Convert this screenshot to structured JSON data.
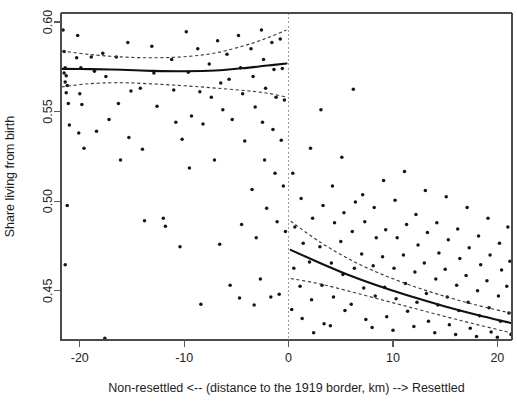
{
  "figure": {
    "kind": "regression-discontinuity-scatterplot",
    "background_color": "#ffffff",
    "point_color": "#151515",
    "fit_color": "#101010",
    "ci_color": "#3b3b3b",
    "cutoff_color": "#9a9a9a"
  },
  "chart_data": {
    "type": "scatter",
    "title": "",
    "subtitle": "",
    "xlabel": "Non-resettled <-- (distance to the 1919 border, km) --> Resettled",
    "ylabel": "Share living from birth",
    "xlim": [
      -21.8,
      21.4
    ],
    "ylim": [
      0.4225,
      0.605
    ],
    "xticks": [
      -20,
      -10,
      0,
      10,
      20
    ],
    "xtick_labels": [
      "-20",
      "-10",
      "0",
      "10",
      "20"
    ],
    "yticks": [
      0.45,
      0.5,
      0.55,
      0.6
    ],
    "ytick_labels": [
      "0.45",
      "0.50",
      "0.55",
      "0.60"
    ],
    "grid": false,
    "legend": null,
    "cutoff": 0,
    "cutoff_style": "dotted-vertical",
    "points": [
      [
        -21.6,
        0.5955
      ],
      [
        -21.5,
        0.5835
      ],
      [
        -21.4,
        0.5745
      ],
      [
        -21.5,
        0.5715
      ],
      [
        -21.3,
        0.57
      ],
      [
        -21.4,
        0.5665
      ],
      [
        -21.2,
        0.5645
      ],
      [
        -21.3,
        0.5605
      ],
      [
        -21.1,
        0.5545
      ],
      [
        -21.0,
        0.5425
      ],
      [
        -21.2,
        0.4975
      ],
      [
        -21.4,
        0.4645
      ],
      [
        -20.2,
        0.5925
      ],
      [
        -20.3,
        0.58
      ],
      [
        -19.9,
        0.5745
      ],
      [
        -20.0,
        0.56
      ],
      [
        -19.8,
        0.554
      ],
      [
        -20.1,
        0.538
      ],
      [
        -19.6,
        0.5295
      ],
      [
        -18.9,
        0.5805
      ],
      [
        -18.6,
        0.5725
      ],
      [
        -18.4,
        0.539
      ],
      [
        -17.8,
        0.5825
      ],
      [
        -17.5,
        0.5695
      ],
      [
        -17.2,
        0.5455
      ],
      [
        -17.6,
        0.4235
      ],
      [
        -16.5,
        0.5805
      ],
      [
        -16.3,
        0.5545
      ],
      [
        -16.1,
        0.523
      ],
      [
        -15.4,
        0.5885
      ],
      [
        -15.1,
        0.5615
      ],
      [
        -15.3,
        0.5355
      ],
      [
        -14.2,
        0.563
      ],
      [
        -14.0,
        0.529
      ],
      [
        -13.8,
        0.489
      ],
      [
        -13.1,
        0.5865
      ],
      [
        -12.9,
        0.5715
      ],
      [
        -12.6,
        0.553
      ],
      [
        -12.0,
        0.4905
      ],
      [
        -11.8,
        0.486
      ],
      [
        -11.2,
        0.579
      ],
      [
        -11.0,
        0.562
      ],
      [
        -10.8,
        0.544
      ],
      [
        -10.4,
        0.4745
      ],
      [
        -10.2,
        0.5345
      ],
      [
        -9.8,
        0.5945
      ],
      [
        -9.6,
        0.572
      ],
      [
        -9.3,
        0.5475
      ],
      [
        -9.5,
        0.5185
      ],
      [
        -8.7,
        0.585
      ],
      [
        -8.5,
        0.561
      ],
      [
        -8.2,
        0.543
      ],
      [
        -8.4,
        0.4425
      ],
      [
        -7.6,
        0.5765
      ],
      [
        -7.4,
        0.558
      ],
      [
        -7.1,
        0.523
      ],
      [
        -6.8,
        0.5895
      ],
      [
        -6.5,
        0.566
      ],
      [
        -6.3,
        0.551
      ],
      [
        -6.6,
        0.476
      ],
      [
        -5.9,
        0.582
      ],
      [
        -5.7,
        0.568
      ],
      [
        -5.4,
        0.5455
      ],
      [
        -5.6,
        0.453
      ],
      [
        -4.8,
        0.5925
      ],
      [
        -4.6,
        0.5745
      ],
      [
        -4.4,
        0.56
      ],
      [
        -4.2,
        0.5335
      ],
      [
        -4.5,
        0.487
      ],
      [
        -4.7,
        0.446
      ],
      [
        -3.6,
        0.585
      ],
      [
        -3.4,
        0.5695
      ],
      [
        -3.2,
        0.5525
      ],
      [
        -3.5,
        0.5065
      ],
      [
        -3.1,
        0.4795
      ],
      [
        -3.3,
        0.442
      ],
      [
        -2.6,
        0.5955
      ],
      [
        -2.4,
        0.579
      ],
      [
        -2.2,
        0.563
      ],
      [
        -2.5,
        0.544
      ],
      [
        -2.3,
        0.523
      ],
      [
        -2.1,
        0.496
      ],
      [
        -2.7,
        0.4565
      ],
      [
        -1.6,
        0.5885
      ],
      [
        -1.4,
        0.5735
      ],
      [
        -1.2,
        0.558
      ],
      [
        -1.5,
        0.54
      ],
      [
        -1.3,
        0.5155
      ],
      [
        -1.1,
        0.4885
      ],
      [
        -1.7,
        0.4465
      ],
      [
        -0.8,
        0.5905
      ],
      [
        -0.6,
        0.574
      ],
      [
        -0.4,
        0.5565
      ],
      [
        -0.7,
        0.534
      ],
      [
        -0.5,
        0.5085
      ],
      [
        -0.3,
        0.483
      ],
      [
        -0.9,
        0.448
      ],
      [
        0.4,
        0.5155
      ],
      [
        0.6,
        0.4855
      ],
      [
        0.5,
        0.4625
      ],
      [
        0.3,
        0.4395
      ],
      [
        1.2,
        0.5015
      ],
      [
        1.4,
        0.4765
      ],
      [
        1.1,
        0.4525
      ],
      [
        1.3,
        0.4345
      ],
      [
        2.1,
        0.5295
      ],
      [
        2.3,
        0.4905
      ],
      [
        2.0,
        0.466
      ],
      [
        2.2,
        0.445
      ],
      [
        2.4,
        0.4265
      ],
      [
        3.1,
        0.551
      ],
      [
        3.3,
        0.4975
      ],
      [
        3.0,
        0.4745
      ],
      [
        3.2,
        0.453
      ],
      [
        3.4,
        0.4315
      ],
      [
        4.2,
        0.5085
      ],
      [
        4.4,
        0.488
      ],
      [
        4.1,
        0.4655
      ],
      [
        4.3,
        0.4465
      ],
      [
        4.0,
        0.4305
      ],
      [
        5.1,
        0.5245
      ],
      [
        5.3,
        0.4935
      ],
      [
        5.0,
        0.4775
      ],
      [
        5.2,
        0.459
      ],
      [
        5.4,
        0.439
      ],
      [
        6.2,
        0.5625
      ],
      [
        6.4,
        0.4995
      ],
      [
        6.1,
        0.483
      ],
      [
        6.3,
        0.4625
      ],
      [
        6.0,
        0.4425
      ],
      [
        7.1,
        0.5035
      ],
      [
        7.3,
        0.4885
      ],
      [
        7.0,
        0.4705
      ],
      [
        7.2,
        0.4515
      ],
      [
        7.4,
        0.434
      ],
      [
        8.2,
        0.4965
      ],
      [
        8.4,
        0.4795
      ],
      [
        8.1,
        0.464
      ],
      [
        8.3,
        0.447
      ],
      [
        8.0,
        0.4295
      ],
      [
        9.1,
        0.5115
      ],
      [
        9.3,
        0.484
      ],
      [
        9.0,
        0.469
      ],
      [
        9.2,
        0.452
      ],
      [
        9.4,
        0.4355
      ],
      [
        10.2,
        0.5005
      ],
      [
        10.4,
        0.4795
      ],
      [
        10.1,
        0.4625
      ],
      [
        10.3,
        0.4455
      ],
      [
        10.0,
        0.428
      ],
      [
        11.1,
        0.5165
      ],
      [
        11.3,
        0.487
      ],
      [
        11.0,
        0.47
      ],
      [
        11.2,
        0.454
      ],
      [
        11.4,
        0.4385
      ],
      [
        12.2,
        0.4925
      ],
      [
        12.4,
        0.4755
      ],
      [
        12.1,
        0.4605
      ],
      [
        12.3,
        0.4435
      ],
      [
        12.0,
        0.43
      ],
      [
        13.1,
        0.506
      ],
      [
        13.3,
        0.4825
      ],
      [
        13.0,
        0.4655
      ],
      [
        13.2,
        0.4485
      ],
      [
        13.4,
        0.433
      ],
      [
        14.2,
        0.488
      ],
      [
        14.4,
        0.471
      ],
      [
        14.1,
        0.4565
      ],
      [
        14.3,
        0.442
      ],
      [
        14.0,
        0.4265
      ],
      [
        15.1,
        0.5025
      ],
      [
        15.3,
        0.4785
      ],
      [
        15.0,
        0.462
      ],
      [
        15.2,
        0.4465
      ],
      [
        15.4,
        0.431
      ],
      [
        16.2,
        0.4845
      ],
      [
        16.4,
        0.468
      ],
      [
        16.1,
        0.453
      ],
      [
        16.3,
        0.439
      ],
      [
        16.0,
        0.4255
      ],
      [
        17.1,
        0.4965
      ],
      [
        17.3,
        0.474
      ],
      [
        17.0,
        0.4585
      ],
      [
        17.2,
        0.4435
      ],
      [
        17.4,
        0.429
      ],
      [
        18.2,
        0.4805
      ],
      [
        18.4,
        0.4645
      ],
      [
        18.1,
        0.45
      ],
      [
        18.3,
        0.436
      ],
      [
        18.0,
        0.4245
      ],
      [
        19.1,
        0.4905
      ],
      [
        19.3,
        0.47
      ],
      [
        19.0,
        0.4555
      ],
      [
        19.2,
        0.4405
      ],
      [
        19.4,
        0.427
      ],
      [
        20.2,
        0.4765
      ],
      [
        20.4,
        0.4615
      ],
      [
        20.1,
        0.447
      ],
      [
        20.3,
        0.433
      ],
      [
        20.0,
        0.424
      ],
      [
        21.0,
        0.4855
      ],
      [
        21.2,
        0.4665
      ],
      [
        20.9,
        0.4525
      ],
      [
        21.1,
        0.4375
      ],
      [
        21.3,
        0.4255
      ]
    ],
    "series": [
      {
        "name": "fit-left",
        "side": "non-resettled",
        "style": "solid",
        "x": [
          -21.7,
          -19,
          -16,
          -13,
          -10,
          -7,
          -4,
          -2,
          -0.2
        ],
        "y": [
          0.5738,
          0.5737,
          0.5733,
          0.5727,
          0.5725,
          0.5729,
          0.5744,
          0.5757,
          0.5768
        ]
      },
      {
        "name": "ci-upper-left",
        "side": "non-resettled",
        "style": "dashed",
        "x": [
          -21.7,
          -19,
          -16,
          -13,
          -10,
          -7,
          -4,
          -2,
          -0.2
        ],
        "y": [
          0.5838,
          0.5818,
          0.5805,
          0.58,
          0.5806,
          0.5827,
          0.5872,
          0.5912,
          0.5955
        ]
      },
      {
        "name": "ci-lower-left",
        "side": "non-resettled",
        "style": "dashed",
        "x": [
          -21.7,
          -19,
          -16,
          -13,
          -10,
          -7,
          -4,
          -2,
          -0.2
        ],
        "y": [
          0.5638,
          0.5656,
          0.5661,
          0.5654,
          0.5644,
          0.5631,
          0.5616,
          0.5602,
          0.5581
        ]
      },
      {
        "name": "fit-right",
        "side": "resettled",
        "style": "solid",
        "x": [
          0.2,
          3,
          6,
          9,
          12,
          15,
          18,
          21.3
        ],
        "y": [
          0.4728,
          0.4655,
          0.4582,
          0.4519,
          0.4463,
          0.4412,
          0.4366,
          0.432
        ]
      },
      {
        "name": "ci-upper-right",
        "side": "resettled",
        "style": "dashed",
        "x": [
          0.2,
          3,
          6,
          9,
          12,
          15,
          18,
          21.3
        ],
        "y": [
          0.4888,
          0.4772,
          0.467,
          0.459,
          0.4524,
          0.4468,
          0.442,
          0.4375
        ]
      },
      {
        "name": "ci-lower-right",
        "side": "resettled",
        "style": "dashed",
        "x": [
          0.2,
          3,
          6,
          9,
          12,
          15,
          18,
          21.3
        ],
        "y": [
          0.4568,
          0.4538,
          0.4494,
          0.4448,
          0.4402,
          0.4356,
          0.4312,
          0.4265
        ]
      }
    ]
  }
}
